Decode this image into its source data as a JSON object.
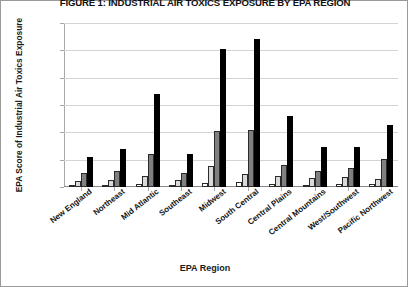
{
  "chart_data": {
    "type": "bar",
    "title": "FIGURE 1: INDUSTRIAL AIR TOXICS EXPOSURE BY EPA REGION",
    "xlabel": "EPA Region",
    "ylabel": "EPA Score of Industrial Air Toxics Exposure",
    "ylim": [
      0,
      30000
    ],
    "yticks": [
      0,
      5000,
      10000,
      15000,
      20000,
      25000,
      30000
    ],
    "ytick_labels": [
      "0",
      "5000",
      "10000",
      "15000",
      "20000",
      "25000",
      "30000"
    ],
    "grid": true,
    "legend": "none",
    "categories": [
      "New England",
      "Northeast",
      "Mid Atlantic",
      "Southeast",
      "Midwest",
      "South Central",
      "Central Plains",
      "Central Mountains",
      "West/Southwest",
      "Pacific Northwest"
    ],
    "series": [
      {
        "name": "series-1",
        "color": "#ffffff",
        "values": [
          300,
          400,
          600,
          350,
          700,
          900,
          500,
          450,
          500,
          550
        ]
      },
      {
        "name": "series-2",
        "color": "#d9d9d9",
        "values": [
          1100,
          1300,
          2000,
          1200,
          3900,
          2400,
          2100,
          1600,
          1900,
          1500
        ]
      },
      {
        "name": "series-3",
        "color": "#808080",
        "values": [
          2500,
          2900,
          6000,
          2500,
          10300,
          10400,
          4100,
          3000,
          3400,
          5200
        ]
      },
      {
        "name": "series-4",
        "color": "#000000",
        "values": [
          5500,
          7000,
          17000,
          6000,
          25200,
          27000,
          13000,
          7300,
          7300,
          11300
        ]
      }
    ]
  }
}
